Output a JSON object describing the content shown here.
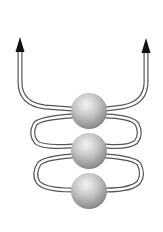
{
  "diagram": {
    "colors": {
      "background": "#ffffff",
      "tube_stroke": "#555555",
      "arrowhead": "#111111",
      "sphere_light": "#f4f4f4",
      "sphere_mid": "#b9b9b9",
      "sphere_dark": "#7a7a7a"
    },
    "spheres": [
      {
        "id": "top",
        "cx": 89,
        "cy": 111,
        "r": 18
      },
      {
        "id": "middle",
        "cx": 89,
        "cy": 151,
        "r": 18
      },
      {
        "id": "bottom",
        "cx": 89,
        "cy": 191,
        "r": 18
      }
    ],
    "arrows": [
      {
        "id": "left",
        "direction": "up",
        "tip_x": 20,
        "tip_y": 37
      },
      {
        "id": "right",
        "direction": "up",
        "tip_x": 146,
        "tip_y": 38
      }
    ]
  }
}
